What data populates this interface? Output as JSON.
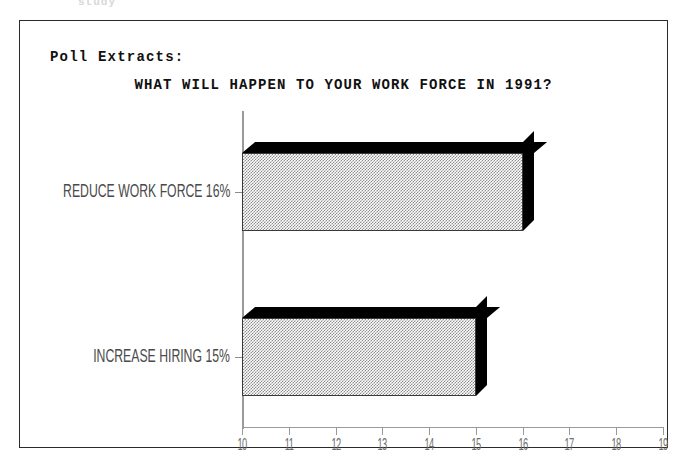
{
  "page": {
    "top_fragment": "study"
  },
  "frame": {
    "section_label": "Poll Extracts:"
  },
  "chart_data": {
    "type": "bar",
    "orientation": "horizontal",
    "title": "WHAT WILL HAPPEN TO YOUR WORK FORCE IN 1991?",
    "xlabel": "",
    "ylabel": "",
    "categories": [
      "REDUCE WORK FORCE 16%",
      "INCREASE HIRING 15%"
    ],
    "values": [
      16,
      15
    ],
    "xlim": [
      10,
      19
    ],
    "xticks": [
      10,
      11,
      12,
      13,
      14,
      15,
      16,
      17,
      18,
      19
    ],
    "xtick_labels": [
      "10",
      "11",
      "12",
      "13",
      "14",
      "15",
      "16",
      "17",
      "18",
      "19"
    ],
    "grid": false,
    "legend": null,
    "style": "3d-shadow-dithered",
    "colors": {
      "bar_face": "#8d8d8d",
      "bar_depth": "#000000",
      "axis": "#9a9a9a",
      "text": "#111111",
      "frame_border": "#2a2a2a"
    },
    "series": [
      {
        "name": "Percent of respondents",
        "values": [
          16,
          15
        ]
      }
    ]
  }
}
